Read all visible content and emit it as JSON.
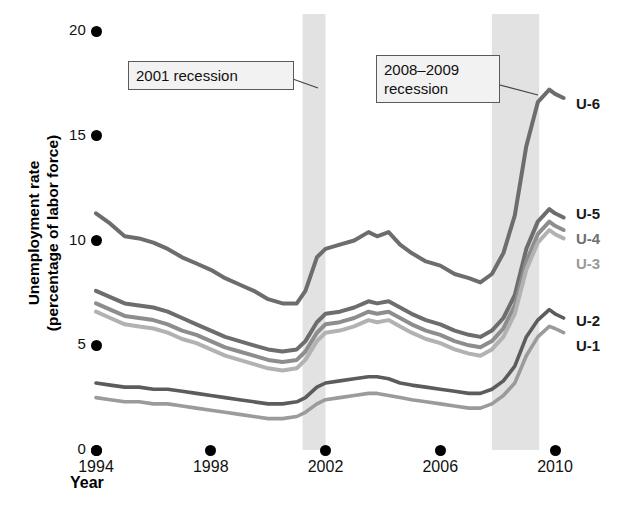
{
  "chart_data": {
    "type": "line",
    "title": "",
    "xlabel": "Year",
    "ylabel": "Unemployment rate (percentage of labor force)",
    "xlim": [
      1994,
      2010.4
    ],
    "ylim": [
      0,
      21.4
    ],
    "xticks": [
      1994,
      1998,
      2002,
      2006,
      2010
    ],
    "xticklabels": [
      "1994",
      "1998",
      "2002",
      "2006",
      "2010"
    ],
    "yticks": [
      0,
      5,
      10,
      15,
      20
    ],
    "yticklabels": [
      "0",
      "5",
      "10",
      "15",
      "20"
    ],
    "grid": false,
    "legend_position": "right-inline",
    "annotations": [
      {
        "id": "rec2001",
        "text": "2001 recession",
        "points_to": "2001 recession band"
      },
      {
        "id": "rec2008",
        "text": "2008–2009 recession",
        "points_to": "2008-2009 recession band"
      }
    ],
    "shaded_bands": [
      {
        "label": "2001 recession",
        "x_start": 2001.2,
        "x_end": 2002.0,
        "color": "#e2e2e2"
      },
      {
        "label": "2008–2009 recession",
        "x_start": 2007.8,
        "x_end": 2009.45,
        "color": "#e2e2e2"
      }
    ],
    "series": [
      {
        "name": "U-6",
        "color": "#6d6d6d",
        "width": 4.0,
        "x": [
          1994.0,
          1994.5,
          1995.0,
          1995.5,
          1996.0,
          1996.5,
          1997.0,
          1997.5,
          1998.0,
          1998.5,
          1999.0,
          1999.5,
          2000.0,
          2000.5,
          2001.0,
          2001.3,
          2001.7,
          2002.0,
          2002.5,
          2003.0,
          2003.5,
          2003.8,
          2004.2,
          2004.6,
          2005.0,
          2005.5,
          2006.0,
          2006.5,
          2007.0,
          2007.4,
          2007.8,
          2008.2,
          2008.6,
          2009.0,
          2009.4,
          2009.8,
          2010.0,
          2010.3
        ],
        "y": [
          11.3,
          10.8,
          10.2,
          10.1,
          9.9,
          9.6,
          9.2,
          8.9,
          8.6,
          8.2,
          7.9,
          7.6,
          7.2,
          7.0,
          7.0,
          7.6,
          9.2,
          9.6,
          9.8,
          10.0,
          10.4,
          10.2,
          10.4,
          9.8,
          9.4,
          9.0,
          8.8,
          8.4,
          8.2,
          8.0,
          8.4,
          9.4,
          11.2,
          14.5,
          16.6,
          17.2,
          17.0,
          16.8
        ],
        "label_text": "U-6"
      },
      {
        "name": "U-5",
        "color": "#6d6d6d",
        "width": 4.0,
        "x": [
          1994.0,
          1994.5,
          1995.0,
          1995.5,
          1996.0,
          1996.5,
          1997.0,
          1997.5,
          1998.0,
          1998.5,
          1999.0,
          1999.5,
          2000.0,
          2000.5,
          2001.0,
          2001.3,
          2001.7,
          2002.0,
          2002.5,
          2003.0,
          2003.5,
          2003.8,
          2004.2,
          2004.6,
          2005.0,
          2005.5,
          2006.0,
          2006.5,
          2007.0,
          2007.4,
          2007.8,
          2008.2,
          2008.6,
          2009.0,
          2009.4,
          2009.8,
          2010.0,
          2010.3
        ],
        "y": [
          7.6,
          7.3,
          7.0,
          6.9,
          6.8,
          6.6,
          6.3,
          6.0,
          5.7,
          5.4,
          5.2,
          5.0,
          4.8,
          4.7,
          4.8,
          5.2,
          6.1,
          6.5,
          6.6,
          6.8,
          7.1,
          7.0,
          7.1,
          6.8,
          6.5,
          6.2,
          6.0,
          5.7,
          5.5,
          5.4,
          5.7,
          6.3,
          7.4,
          9.6,
          10.9,
          11.5,
          11.3,
          11.1
        ],
        "label_text": "U-5"
      },
      {
        "name": "U-4",
        "color": "#8d8d8d",
        "width": 4.0,
        "x": [
          1994.0,
          1994.5,
          1995.0,
          1995.5,
          1996.0,
          1996.5,
          1997.0,
          1997.5,
          1998.0,
          1998.5,
          1999.0,
          1999.5,
          2000.0,
          2000.5,
          2001.0,
          2001.3,
          2001.7,
          2002.0,
          2002.5,
          2003.0,
          2003.5,
          2003.8,
          2004.2,
          2004.6,
          2005.0,
          2005.5,
          2006.0,
          2006.5,
          2007.0,
          2007.4,
          2007.8,
          2008.2,
          2008.6,
          2009.0,
          2009.4,
          2009.8,
          2010.0,
          2010.3
        ],
        "y": [
          7.0,
          6.7,
          6.4,
          6.3,
          6.2,
          6.0,
          5.7,
          5.5,
          5.2,
          4.9,
          4.7,
          4.5,
          4.3,
          4.2,
          4.3,
          4.7,
          5.6,
          6.0,
          6.1,
          6.3,
          6.6,
          6.5,
          6.6,
          6.3,
          6.0,
          5.7,
          5.5,
          5.2,
          5.0,
          4.9,
          5.2,
          5.8,
          6.9,
          9.0,
          10.3,
          10.9,
          10.7,
          10.5
        ],
        "label_text": "U-4"
      },
      {
        "name": "U-3",
        "color": "#b2b2b2",
        "width": 4.0,
        "x": [
          1994.0,
          1994.5,
          1995.0,
          1995.5,
          1996.0,
          1996.5,
          1997.0,
          1997.5,
          1998.0,
          1998.5,
          1999.0,
          1999.5,
          2000.0,
          2000.5,
          2001.0,
          2001.3,
          2001.7,
          2002.0,
          2002.5,
          2003.0,
          2003.5,
          2003.8,
          2004.2,
          2004.6,
          2005.0,
          2005.5,
          2006.0,
          2006.5,
          2007.0,
          2007.4,
          2007.8,
          2008.2,
          2008.6,
          2009.0,
          2009.4,
          2009.8,
          2010.0,
          2010.3
        ],
        "y": [
          6.6,
          6.3,
          6.0,
          5.9,
          5.8,
          5.6,
          5.3,
          5.1,
          4.8,
          4.5,
          4.3,
          4.1,
          3.9,
          3.8,
          3.9,
          4.3,
          5.2,
          5.6,
          5.7,
          5.9,
          6.2,
          6.1,
          6.2,
          5.9,
          5.6,
          5.3,
          5.1,
          4.8,
          4.6,
          4.5,
          4.8,
          5.4,
          6.5,
          8.6,
          9.9,
          10.5,
          10.3,
          10.1
        ],
        "label_text": "U-3"
      },
      {
        "name": "U-2",
        "color": "#5c5c5c",
        "width": 3.6,
        "x": [
          1994.0,
          1994.5,
          1995.0,
          1995.5,
          1996.0,
          1996.5,
          1997.0,
          1997.5,
          1998.0,
          1998.5,
          1999.0,
          1999.5,
          2000.0,
          2000.5,
          2001.0,
          2001.3,
          2001.7,
          2002.0,
          2002.5,
          2003.0,
          2003.5,
          2003.8,
          2004.2,
          2004.6,
          2005.0,
          2005.5,
          2006.0,
          2006.5,
          2007.0,
          2007.4,
          2007.8,
          2008.2,
          2008.6,
          2009.0,
          2009.4,
          2009.8,
          2010.0,
          2010.3
        ],
        "y": [
          3.2,
          3.1,
          3.0,
          3.0,
          2.9,
          2.9,
          2.8,
          2.7,
          2.6,
          2.5,
          2.4,
          2.3,
          2.2,
          2.2,
          2.3,
          2.5,
          3.0,
          3.2,
          3.3,
          3.4,
          3.5,
          3.5,
          3.4,
          3.2,
          3.1,
          3.0,
          2.9,
          2.8,
          2.7,
          2.7,
          2.9,
          3.3,
          4.0,
          5.4,
          6.2,
          6.7,
          6.5,
          6.3
        ],
        "label_text": "U-2"
      },
      {
        "name": "U-1",
        "color": "#9b9b9b",
        "width": 3.6,
        "x": [
          1994.0,
          1994.5,
          1995.0,
          1995.5,
          1996.0,
          1996.5,
          1997.0,
          1997.5,
          1998.0,
          1998.5,
          1999.0,
          1999.5,
          2000.0,
          2000.5,
          2001.0,
          2001.3,
          2001.7,
          2002.0,
          2002.5,
          2003.0,
          2003.5,
          2003.8,
          2004.2,
          2004.6,
          2005.0,
          2005.5,
          2006.0,
          2006.5,
          2007.0,
          2007.4,
          2007.8,
          2008.2,
          2008.6,
          2009.0,
          2009.4,
          2009.8,
          2010.0,
          2010.3
        ],
        "y": [
          2.5,
          2.4,
          2.3,
          2.3,
          2.2,
          2.2,
          2.1,
          2.0,
          1.9,
          1.8,
          1.7,
          1.6,
          1.5,
          1.5,
          1.6,
          1.8,
          2.2,
          2.4,
          2.5,
          2.6,
          2.7,
          2.7,
          2.6,
          2.5,
          2.4,
          2.3,
          2.2,
          2.1,
          2.0,
          2.0,
          2.2,
          2.6,
          3.2,
          4.5,
          5.4,
          5.9,
          5.8,
          5.6
        ],
        "label_text": "U-1"
      }
    ]
  },
  "axes": {
    "y_title_line1": "Unemployment rate",
    "y_title_line2": "(percentage of labor force)",
    "x_title": "Year"
  }
}
